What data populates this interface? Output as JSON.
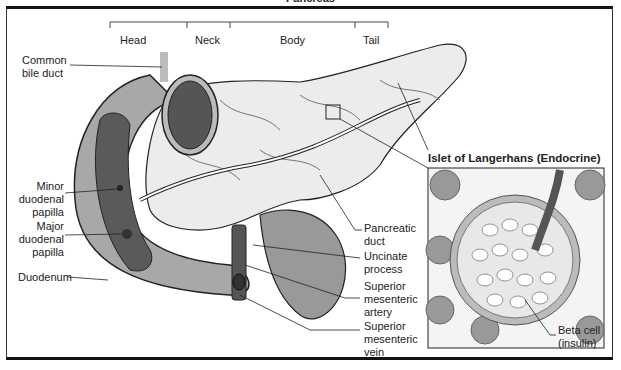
{
  "title": "Pancreas",
  "regions": [
    {
      "label": "Head"
    },
    {
      "label": "Neck"
    },
    {
      "label": "Body"
    },
    {
      "label": "Tail"
    }
  ],
  "labels_left": {
    "common_bile_duct": "Common bile duct",
    "minor_papilla": "Minor duodenal papilla",
    "major_papilla": "Major duodenal papilla",
    "duodenum": "Duodenum"
  },
  "labels_right": {
    "pancreatic_duct": "Pancreatic duct",
    "uncinate_process": "Uncinate process",
    "sma": "Superior mesenteric artery",
    "smv": "Superior mesenteric vein"
  },
  "inset": {
    "title": "Islet of Langerhans (Endocrine)",
    "beta_cell": "Beta cell (insulin)"
  },
  "colors": {
    "duodenum": "#a8a8a8",
    "duodenum_inner": "#5a5a5a",
    "pancreas": "#e6e6e6",
    "outline": "#222222"
  }
}
